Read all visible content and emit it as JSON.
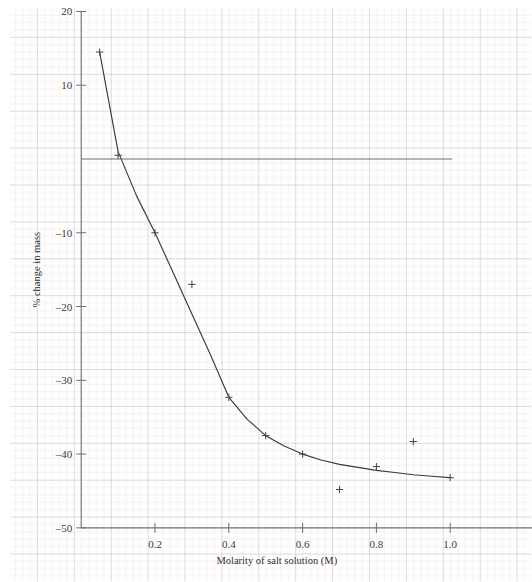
{
  "chart_data": {
    "type": "scatter",
    "title": "",
    "subtitle": "",
    "xlabel": "Molarity of salt solution (M)",
    "ylabel": "% change in mass",
    "xlim": [
      0.0,
      1.08
    ],
    "ylim": [
      -50,
      20
    ],
    "xticks": [
      "0.2",
      "0.4",
      "0.6",
      "0.8",
      "1.0"
    ],
    "xtick_values": [
      0.2,
      0.4,
      0.6,
      0.8,
      1.0
    ],
    "yticks": [
      "20",
      "10",
      "–10",
      "–20",
      "–30",
      "–40",
      "–50"
    ],
    "ytick_values": [
      20,
      10,
      -10,
      -20,
      -30,
      -40,
      -50
    ],
    "grid": "graph-paper minor and major gridlines",
    "legend": "none",
    "marker": "plus",
    "points": [
      {
        "x": 0.05,
        "y": 14.5
      },
      {
        "x": 0.1,
        "y": 0.5
      },
      {
        "x": 0.2,
        "y": -10.0
      },
      {
        "x": 0.3,
        "y": -17.0
      },
      {
        "x": 0.4,
        "y": -32.3
      },
      {
        "x": 0.5,
        "y": -37.5
      },
      {
        "x": 0.6,
        "y": -40.0
      },
      {
        "x": 0.7,
        "y": -44.8
      },
      {
        "x": 0.8,
        "y": -41.7
      },
      {
        "x": 0.9,
        "y": -38.3
      },
      {
        "x": 1.0,
        "y": -43.2
      }
    ],
    "fit_curve": {
      "description": "smooth best-fit curve through the points",
      "x": [
        0.05,
        0.1,
        0.15,
        0.2,
        0.25,
        0.3,
        0.35,
        0.4,
        0.45,
        0.5,
        0.55,
        0.6,
        0.65,
        0.7,
        0.75,
        0.8,
        0.85,
        0.9,
        0.95,
        1.0
      ],
      "y": [
        14.5,
        1.0,
        -5.0,
        -10.0,
        -15.5,
        -21.0,
        -26.5,
        -32.3,
        -35.3,
        -37.5,
        -38.9,
        -40.0,
        -40.8,
        -41.4,
        -41.8,
        -42.2,
        -42.5,
        -42.8,
        -43.0,
        -43.2
      ]
    },
    "zero_line": 0,
    "colors": {
      "curve": "#3a3a3a",
      "marker": "#4a4a4a",
      "axis": "#6e6e6e",
      "major_grid": "#b9b4c4",
      "minor_grid": "#e7d9de",
      "text": "#3a3a3a"
    }
  }
}
